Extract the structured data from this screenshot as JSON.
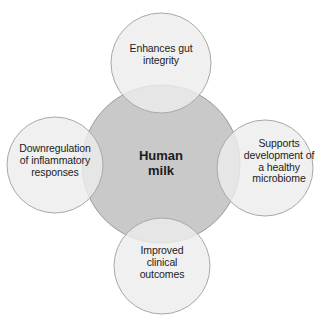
{
  "diagram": {
    "type": "venn-overlap-circles",
    "background_color": "#ffffff",
    "center": {
      "id": "human-milk",
      "label": "Human\nmilk",
      "fill_color": "#c9c9c9",
      "stroke_color": "#9a9a9a",
      "text_color": "#1c1c1c",
      "bold": true
    },
    "satellites": [
      {
        "id": "enhances-gut-integrity",
        "position": "top",
        "label": "Enhances gut\nintegrity",
        "fill_color": "#e6e6e6",
        "stroke_color": "#a8a8a8",
        "text_color": "#1c1c1c"
      },
      {
        "id": "supports-microbiome",
        "position": "right",
        "label": "Supports\ndevelopment of\na healthy\nmicrobiome",
        "fill_color": "#e6e6e6",
        "stroke_color": "#a8a8a8",
        "text_color": "#1c1c1c"
      },
      {
        "id": "improved-clinical-outcomes",
        "position": "bottom",
        "label": "Improved\nclinical\noutcomes",
        "fill_color": "#e6e6e6",
        "stroke_color": "#a8a8a8",
        "text_color": "#1c1c1c"
      },
      {
        "id": "downregulation-inflammatory",
        "position": "left",
        "label": "Downregulation\nof inflammatory\nresponses",
        "fill_color": "#e6e6e6",
        "stroke_color": "#a8a8a8",
        "text_color": "#1c1c1c"
      }
    ]
  }
}
